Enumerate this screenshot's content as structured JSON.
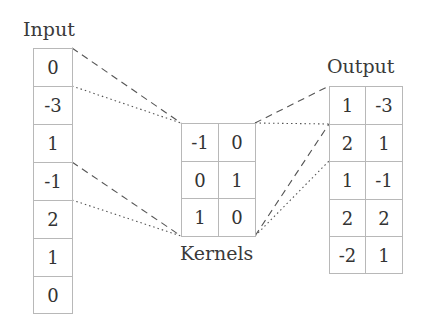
{
  "input": {
    "title": "Input",
    "values": [
      "0",
      "-3",
      "1",
      "-1",
      "2",
      "1",
      "0"
    ]
  },
  "kernels": {
    "title": "Kernels",
    "rows": [
      [
        "-1",
        "0"
      ],
      [
        "0",
        "1"
      ],
      [
        "1",
        "0"
      ]
    ]
  },
  "output": {
    "title": "Output",
    "rows": [
      [
        "1",
        "-3"
      ],
      [
        "2",
        "1"
      ],
      [
        "1",
        "-1"
      ],
      [
        "2",
        "2"
      ],
      [
        "-2",
        "1"
      ]
    ]
  },
  "connectors": [
    {
      "from": "input-row-0-top",
      "to": "kernel-top-left",
      "style": "dashed"
    },
    {
      "from": "input-row-1-top",
      "to": "kernel-top-left",
      "style": "dotted"
    },
    {
      "from": "input-row-3-top",
      "to": "kernel-bottom-left",
      "style": "dashed"
    },
    {
      "from": "input-row-4-top",
      "to": "kernel-bottom-left",
      "style": "dotted"
    },
    {
      "from": "kernel-top-right",
      "to": "output-row-0-top",
      "style": "dashed"
    },
    {
      "from": "kernel-top-right",
      "to": "output-row-1-top",
      "style": "dotted"
    },
    {
      "from": "kernel-bottom-right",
      "to": "output-row-1-top",
      "style": "dashed"
    },
    {
      "from": "kernel-bottom-right",
      "to": "output-row-2-top",
      "style": "dotted"
    }
  ]
}
